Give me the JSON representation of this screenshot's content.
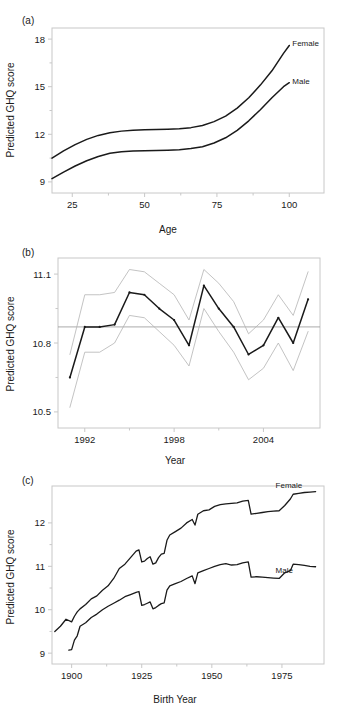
{
  "figure": {
    "panels": [
      {
        "id": "a",
        "letter": "(a)",
        "xlabel": "Age",
        "ylabel": "Predicted GHQ score",
        "xticks": [
          "25",
          "50",
          "75",
          "100"
        ],
        "yticks": [
          "9",
          "12",
          "15",
          "18"
        ],
        "series_labels": [
          "Female",
          "Male"
        ]
      },
      {
        "id": "b",
        "letter": "(b)",
        "xlabel": "Year",
        "ylabel": "Predicted GHQ score",
        "xticks": [
          "1992",
          "1998",
          "2004"
        ],
        "yticks": [
          "10.5",
          "10.8",
          "11.1"
        ],
        "series_labels": []
      },
      {
        "id": "c",
        "letter": "(c)",
        "xlabel": "Birth Year",
        "ylabel": "Predicted GHQ score",
        "xticks": [
          "1900",
          "1925",
          "1950",
          "1975"
        ],
        "yticks": [
          "9",
          "10",
          "11",
          "12"
        ],
        "series_labels": [
          "Female",
          "Male"
        ]
      }
    ]
  },
  "colors": {
    "line": "#1a1a1a",
    "ci_line": "#b4b4b4",
    "frame": "#c8c8c8",
    "reference_line": "#969696",
    "background": "#ffffff"
  },
  "chart_data": [
    {
      "type": "line",
      "panel": "a",
      "title": "",
      "xlabel": "Age",
      "ylabel": "Predicted GHQ score",
      "xlim": [
        18,
        112
      ],
      "ylim": [
        8.3,
        18.7
      ],
      "xticks": [
        25,
        50,
        75,
        100
      ],
      "yticks": [
        9,
        12,
        15,
        18
      ],
      "grid": false,
      "legend": "inline-labels",
      "series": [
        {
          "name": "Female",
          "x": [
            18,
            22,
            26,
            30,
            34,
            38,
            42,
            46,
            50,
            54,
            58,
            62,
            66,
            70,
            74,
            78,
            82,
            86,
            90,
            94,
            98,
            100
          ],
          "values": [
            10.5,
            10.95,
            11.35,
            11.68,
            11.93,
            12.1,
            12.2,
            12.25,
            12.28,
            12.3,
            12.32,
            12.35,
            12.42,
            12.55,
            12.8,
            13.15,
            13.65,
            14.3,
            15.1,
            16.0,
            17.1,
            17.6
          ]
        },
        {
          "name": "Male",
          "x": [
            18,
            22,
            26,
            30,
            34,
            38,
            42,
            46,
            50,
            54,
            58,
            62,
            66,
            70,
            74,
            78,
            82,
            86,
            90,
            94,
            98,
            100
          ],
          "values": [
            9.2,
            9.62,
            10.0,
            10.33,
            10.6,
            10.8,
            10.9,
            10.95,
            10.97,
            10.98,
            11.0,
            11.03,
            11.1,
            11.22,
            11.45,
            11.78,
            12.25,
            12.85,
            13.55,
            14.3,
            15.0,
            15.25
          ]
        }
      ]
    },
    {
      "type": "line",
      "panel": "b",
      "title": "",
      "xlabel": "Year",
      "ylabel": "Predicted GHQ score",
      "xlim": [
        1990.2,
        2007.8
      ],
      "ylim": [
        10.43,
        11.17
      ],
      "xticks": [
        1992,
        1998,
        2004
      ],
      "yticks": [
        10.5,
        10.8,
        11.1
      ],
      "grid": false,
      "reference_line_y": 10.87,
      "x": [
        1991,
        1992,
        1993,
        1994,
        1995,
        1996,
        1997,
        1998,
        1999,
        2000,
        2001,
        2002,
        2003,
        2004,
        2005,
        2006,
        2007
      ],
      "series": [
        {
          "name": "estimate",
          "values": [
            10.65,
            10.87,
            10.87,
            10.88,
            11.02,
            11.01,
            10.95,
            10.9,
            10.79,
            11.05,
            10.95,
            10.87,
            10.75,
            10.79,
            10.91,
            10.8,
            10.99
          ]
        },
        {
          "name": "upper CI",
          "values": [
            10.75,
            11.01,
            11.01,
            11.02,
            11.12,
            11.11,
            11.06,
            11.01,
            10.9,
            11.12,
            11.06,
            10.98,
            10.84,
            10.9,
            11.01,
            10.92,
            11.11
          ]
        },
        {
          "name": "lower CI",
          "values": [
            10.52,
            10.76,
            10.76,
            10.8,
            10.92,
            10.91,
            10.85,
            10.79,
            10.7,
            10.95,
            10.85,
            10.76,
            10.64,
            10.69,
            10.8,
            10.68,
            10.85
          ]
        }
      ]
    },
    {
      "type": "line",
      "panel": "c",
      "title": "",
      "xlabel": "Birth Year",
      "ylabel": "Predicted GHQ score",
      "xlim": [
        1893,
        1990
      ],
      "ylim": [
        8.75,
        12.85
      ],
      "xticks": [
        1900,
        1925,
        1950,
        1975
      ],
      "yticks": [
        9,
        10,
        11,
        12
      ],
      "grid": false,
      "legend": "inline-labels",
      "series": [
        {
          "name": "Female",
          "x": [
            1894,
            1896,
            1898,
            1900,
            1901,
            1902,
            1903,
            1905,
            1907,
            1909,
            1911,
            1913,
            1915,
            1917,
            1919,
            1921,
            1923,
            1924,
            1925,
            1926,
            1927,
            1928,
            1929,
            1930,
            1931,
            1932,
            1933,
            1934,
            1935,
            1937,
            1939,
            1941,
            1943,
            1944,
            1945,
            1947,
            1949,
            1951,
            1953,
            1955,
            1957,
            1959,
            1961,
            1963,
            1964,
            1966,
            1968,
            1970,
            1972,
            1974,
            1976,
            1978,
            1979,
            1981,
            1983,
            1985,
            1987
          ],
          "values": [
            9.5,
            9.62,
            9.78,
            9.72,
            9.85,
            9.95,
            10.02,
            10.12,
            10.25,
            10.32,
            10.45,
            10.55,
            10.72,
            10.95,
            11.05,
            11.2,
            11.35,
            11.38,
            11.1,
            11.12,
            11.18,
            11.22,
            11.05,
            11.08,
            11.2,
            11.28,
            11.3,
            11.6,
            11.72,
            11.8,
            11.88,
            12.0,
            12.08,
            11.95,
            12.2,
            12.28,
            12.3,
            12.38,
            12.42,
            12.44,
            12.45,
            12.46,
            12.5,
            12.52,
            12.2,
            12.22,
            12.24,
            12.26,
            12.27,
            12.28,
            12.4,
            12.55,
            12.66,
            12.68,
            12.7,
            12.71,
            12.72
          ]
        },
        {
          "name": "Male",
          "x": [
            1899,
            1900,
            1901,
            1902,
            1903,
            1905,
            1907,
            1909,
            1911,
            1913,
            1915,
            1917,
            1919,
            1921,
            1923,
            1924,
            1925,
            1926,
            1927,
            1928,
            1929,
            1930,
            1931,
            1932,
            1933,
            1934,
            1935,
            1937,
            1939,
            1941,
            1943,
            1944,
            1945,
            1947,
            1949,
            1951,
            1953,
            1955,
            1957,
            1959,
            1961,
            1963,
            1964,
            1966,
            1968,
            1970,
            1972,
            1974,
            1976,
            1978,
            1979,
            1981,
            1983,
            1985,
            1987
          ],
          "values": [
            9.07,
            9.08,
            9.3,
            9.4,
            9.62,
            9.7,
            9.82,
            9.9,
            10.0,
            10.08,
            10.15,
            10.22,
            10.3,
            10.35,
            10.4,
            10.42,
            10.1,
            10.12,
            10.15,
            10.18,
            10.02,
            10.05,
            10.1,
            10.14,
            10.16,
            10.45,
            10.55,
            10.6,
            10.65,
            10.72,
            10.78,
            10.6,
            10.85,
            10.9,
            10.95,
            11.0,
            11.04,
            11.06,
            11.03,
            11.04,
            11.08,
            11.1,
            10.75,
            10.76,
            10.75,
            10.74,
            10.73,
            10.72,
            10.85,
            10.9,
            11.05,
            11.04,
            11.02,
            11.0,
            10.99
          ]
        }
      ]
    }
  ]
}
